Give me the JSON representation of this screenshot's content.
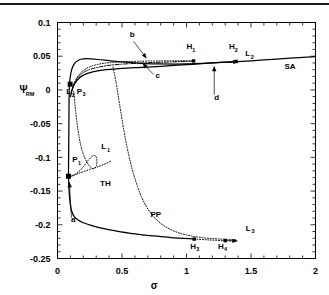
{
  "figure": {
    "kind": "bifurcation-diagram",
    "background": "#ffffff",
    "frame_color": "#000000"
  },
  "chart_data": {
    "type": "line",
    "title": "",
    "xlabel": "σ",
    "ylabel": "Ψ",
    "ylabel_sub": "RM",
    "xlim": [
      0,
      2
    ],
    "ylim": [
      -0.25,
      0.1
    ],
    "xticks": [
      0,
      0.5,
      1,
      1.5,
      2
    ],
    "xticklabels": [
      "0",
      "0.5",
      "1",
      "1.5",
      "2"
    ],
    "yticks": [
      0.1,
      0.05,
      0,
      -0.05,
      -0.1,
      -0.15,
      -0.2,
      -0.25
    ],
    "yticklabels": [
      "0.1",
      "0.05",
      "0",
      "-0.05",
      "-0.1",
      "-0.15",
      "-0.2",
      "-0.25"
    ],
    "grid": false,
    "legend": "none",
    "minor_ticks": true,
    "series": [
      {
        "name": "SA",
        "style": "solid",
        "comment": "upper solid stable branch, rises from P2 then gently to right edge",
        "points": [
          [
            0.085,
            -0.128
          ],
          [
            0.088,
            -0.06
          ],
          [
            0.091,
            0.0
          ],
          [
            0.098,
            0.018
          ],
          [
            0.11,
            0.03
          ],
          [
            0.128,
            0.038
          ],
          [
            0.15,
            0.0425
          ],
          [
            0.18,
            0.0455
          ],
          [
            0.23,
            0.0465
          ],
          [
            0.3,
            0.0455
          ],
          [
            0.4,
            0.0435
          ],
          [
            0.5,
            0.0415
          ],
          [
            0.65,
            0.0395
          ],
          [
            0.8,
            0.0385
          ],
          [
            1.0,
            0.0385
          ],
          [
            1.2,
            0.04
          ],
          [
            1.4,
            0.042
          ],
          [
            1.6,
            0.0445
          ],
          [
            1.8,
            0.047
          ],
          [
            2.0,
            0.0495
          ]
        ]
      },
      {
        "name": "lower-solid-upper-arc",
        "style": "solid",
        "comment": "second solid curve slightly below SA, merges near H2",
        "points": [
          [
            0.1,
            -0.01
          ],
          [
            0.12,
            0.004
          ],
          [
            0.15,
            0.014
          ],
          [
            0.2,
            0.022
          ],
          [
            0.28,
            0.027
          ],
          [
            0.38,
            0.03
          ],
          [
            0.5,
            0.032
          ],
          [
            0.65,
            0.0335
          ],
          [
            0.8,
            0.035
          ],
          [
            1.0,
            0.0375
          ],
          [
            1.2,
            0.04
          ],
          [
            1.38,
            0.042
          ]
        ]
      },
      {
        "name": "b-dashed-branch",
        "style": "dashed",
        "comment": "dash-dot branch between the two solid arcs ending near H1",
        "points": [
          [
            0.105,
            -0.004
          ],
          [
            0.13,
            0.01
          ],
          [
            0.165,
            0.02
          ],
          [
            0.22,
            0.028
          ],
          [
            0.3,
            0.033
          ],
          [
            0.4,
            0.0365
          ],
          [
            0.52,
            0.0385
          ],
          [
            0.66,
            0.04
          ],
          [
            0.8,
            0.041
          ],
          [
            0.95,
            0.042
          ],
          [
            1.05,
            0.0428
          ]
        ]
      },
      {
        "name": "dotted-branch-upper",
        "style": "dotted",
        "comment": "dotted branch from P3 region arcing up to the H1 marker",
        "points": [
          [
            0.115,
            0.0
          ],
          [
            0.145,
            0.016
          ],
          [
            0.19,
            0.027
          ],
          [
            0.26,
            0.035
          ],
          [
            0.36,
            0.0395
          ],
          [
            0.48,
            0.0415
          ],
          [
            0.62,
            0.0425
          ],
          [
            0.78,
            0.043
          ],
          [
            0.93,
            0.0432
          ],
          [
            1.05,
            0.043
          ]
        ]
      },
      {
        "name": "L1",
        "style": "dotted",
        "comment": "dotted loop descending from P3 and turning back to TH",
        "points": [
          [
            0.125,
            -0.002
          ],
          [
            0.14,
            -0.03
          ],
          [
            0.158,
            -0.058
          ],
          [
            0.18,
            -0.082
          ],
          [
            0.21,
            -0.1
          ],
          [
            0.245,
            -0.112
          ],
          [
            0.278,
            -0.117
          ],
          [
            0.3,
            -0.113
          ],
          [
            0.305,
            -0.104
          ],
          [
            0.295,
            -0.098
          ],
          [
            0.272,
            -0.098
          ],
          [
            0.24,
            -0.104
          ],
          [
            0.2,
            -0.114
          ],
          [
            0.16,
            -0.122
          ],
          [
            0.12,
            -0.127
          ],
          [
            0.09,
            -0.129
          ]
        ]
      },
      {
        "name": "TH",
        "style": "dotted",
        "comment": "dotted line from P1 running right and down",
        "points": [
          [
            0.09,
            -0.129
          ],
          [
            0.16,
            -0.124
          ],
          [
            0.25,
            -0.118
          ],
          [
            0.34,
            -0.112
          ],
          [
            0.42,
            -0.105
          ]
        ]
      },
      {
        "name": "L2-descending",
        "style": "dotted",
        "comment": "long dotted branch falling from upper arc down to the lower-right H markers",
        "points": [
          [
            0.43,
            0.034
          ],
          [
            0.455,
            0.01
          ],
          [
            0.48,
            -0.02
          ],
          [
            0.51,
            -0.055
          ],
          [
            0.545,
            -0.09
          ],
          [
            0.59,
            -0.125
          ],
          [
            0.65,
            -0.158
          ],
          [
            0.72,
            -0.182
          ],
          [
            0.8,
            -0.198
          ],
          [
            0.9,
            -0.209
          ],
          [
            1.0,
            -0.215
          ],
          [
            1.12,
            -0.219
          ],
          [
            1.25,
            -0.221
          ],
          [
            1.38,
            -0.222
          ]
        ]
      },
      {
        "name": "PP",
        "style": "solid",
        "comment": "lower solid branch descending steeply then flattening to the right",
        "points": [
          [
            0.085,
            -0.128
          ],
          [
            0.09,
            -0.15
          ],
          [
            0.098,
            -0.168
          ],
          [
            0.11,
            -0.18
          ],
          [
            0.13,
            -0.188
          ],
          [
            0.16,
            -0.193
          ],
          [
            0.2,
            -0.197
          ],
          [
            0.26,
            -0.201
          ],
          [
            0.34,
            -0.205
          ],
          [
            0.45,
            -0.209
          ],
          [
            0.58,
            -0.213
          ],
          [
            0.72,
            -0.216
          ],
          [
            0.88,
            -0.219
          ],
          [
            1.06,
            -0.221
          ]
        ]
      },
      {
        "name": "H3-H4-connector",
        "style": "dotted",
        "comment": "dotted segment joining the lower H markers to L3 arrow tip",
        "points": [
          [
            1.06,
            -0.221
          ],
          [
            1.18,
            -0.2225
          ],
          [
            1.3,
            -0.2235
          ],
          [
            1.39,
            -0.2238
          ]
        ]
      }
    ],
    "markers": [
      {
        "label": "P1",
        "sub": "1",
        "x": 0.085,
        "y": -0.128,
        "shape": "square",
        "size": "large"
      },
      {
        "label": "P2",
        "sub": "2",
        "x": 0.098,
        "y": 0.0085,
        "shape": "square",
        "size": "large"
      },
      {
        "label": "H1",
        "sub": "1",
        "x": 1.055,
        "y": 0.043,
        "shape": "square",
        "size": "small"
      },
      {
        "label": "H2",
        "sub": "2",
        "x": 1.385,
        "y": 0.0422,
        "shape": "square",
        "size": "small"
      },
      {
        "label": "H3",
        "sub": "3",
        "x": 1.06,
        "y": -0.2212,
        "shape": "square",
        "size": "small"
      },
      {
        "label": "H4",
        "sub": "4",
        "x": 1.3,
        "y": -0.2235,
        "shape": "square",
        "size": "small"
      }
    ],
    "annotations": [
      {
        "text": "SA",
        "x": 1.76,
        "y": 0.031,
        "sub": ""
      },
      {
        "text": "PP",
        "x": 0.72,
        "y": -0.188,
        "sub": ""
      },
      {
        "text": "TH",
        "x": 0.33,
        "y": -0.142,
        "sub": ""
      },
      {
        "text": "L",
        "sub": "1",
        "x": 0.34,
        "y": -0.088
      },
      {
        "text": "L",
        "sub": "2",
        "x": 1.455,
        "y": 0.05
      },
      {
        "text": "L",
        "sub": "3",
        "x": 1.46,
        "y": -0.2085
      },
      {
        "text": "L",
        "sub": "2",
        "x": 0.068,
        "y": -0.006
      },
      {
        "text": "P",
        "sub": "3",
        "x": 0.15,
        "y": -0.0055
      },
      {
        "text": "P",
        "sub": "1",
        "x": 0.115,
        "y": -0.1075
      },
      {
        "text": "b",
        "x": 0.56,
        "y": 0.079,
        "sub": ""
      },
      {
        "text": "c",
        "x": 0.76,
        "y": 0.0175,
        "sub": ""
      },
      {
        "text": "d",
        "x": 1.215,
        "y": -0.0145,
        "sub": ""
      },
      {
        "text": "a",
        "x": 0.105,
        "y": -0.196,
        "sub": ""
      }
    ],
    "arrows": [
      {
        "name": "arrow-b",
        "from": [
          0.59,
          0.072
        ],
        "to": [
          0.69,
          0.047
        ]
      },
      {
        "name": "arrow-c",
        "from": [
          0.745,
          0.023
        ],
        "to": [
          0.66,
          0.0395
        ]
      },
      {
        "name": "arrow-d",
        "from": [
          1.215,
          -0.007
        ],
        "to": [
          1.215,
          0.035
        ]
      },
      {
        "name": "arrow-a",
        "from": [
          0.108,
          -0.1895
        ],
        "to": [
          0.092,
          -0.137
        ]
      },
      {
        "name": "arrow-L2-tip",
        "to": [
          1.4,
          0.042
        ]
      },
      {
        "name": "arrow-L3-tip",
        "to": [
          1.395,
          -0.224
        ]
      }
    ]
  }
}
